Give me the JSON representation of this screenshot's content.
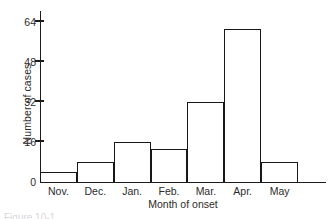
{
  "chart_data": {
    "type": "bar",
    "title": "",
    "xlabel": "Month of onset",
    "ylabel": "Number of cases",
    "categories": [
      "Nov.",
      "Dec.",
      "Jan.",
      "Feb.",
      "Mar.",
      "Apr.",
      "May"
    ],
    "values": [
      4,
      8,
      16,
      13,
      32,
      61,
      8
    ],
    "ylim": [
      0,
      68
    ],
    "yticks": [
      0,
      16,
      32,
      48,
      64
    ],
    "ytick_labels": [
      "0",
      "16",
      "32",
      "48",
      "64"
    ],
    "grid": false,
    "legend": null,
    "bar_style": {
      "fill": "none",
      "outline_color": "#171717",
      "outline_width": 1.4,
      "gap": 0
    },
    "axis_color": "#1c1c1c",
    "text_color": "#2b2b2b"
  },
  "figure": {
    "caption_partial": "Figure 10-1"
  }
}
